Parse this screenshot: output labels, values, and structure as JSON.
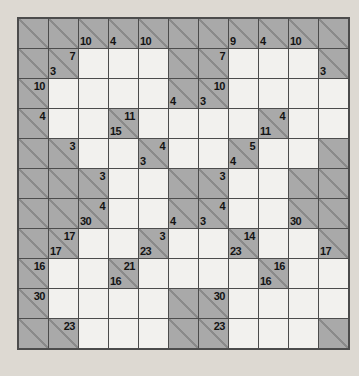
{
  "puzzle": {
    "type": "kakuro",
    "rows": 11,
    "cols": 11,
    "legend": {
      "X": "blocked gray cell with diagonal",
      ".": "white entry cell",
      "a": "across clue (top-right of diagonal)",
      "d": "down clue (bottom-left of diagonal)"
    },
    "cells": [
      [
        "X",
        "X",
        {
          "d": 10
        },
        {
          "d": 4
        },
        {
          "d": 10
        },
        "X",
        "X",
        {
          "d": 9
        },
        {
          "d": 4
        },
        {
          "d": 10
        },
        "X"
      ],
      [
        "X",
        {
          "a": 7,
          "d": 3
        },
        ".",
        ".",
        ".",
        "X",
        {
          "a": 7
        },
        ".",
        ".",
        ".",
        {
          "d": 3
        }
      ],
      [
        {
          "a": 10
        },
        ".",
        ".",
        ".",
        ".",
        {
          "d": 4
        },
        {
          "a": 10,
          "d": 3
        },
        ".",
        ".",
        ".",
        "."
      ],
      [
        {
          "a": 4
        },
        ".",
        ".",
        {
          "a": 11,
          "d": 15
        },
        ".",
        ".",
        ".",
        ".",
        {
          "a": 4,
          "d": 11
        },
        ".",
        "."
      ],
      [
        "X",
        {
          "a": 3
        },
        ".",
        ".",
        {
          "a": 4,
          "d": 3
        },
        ".",
        ".",
        {
          "a": 5,
          "d": 4
        },
        ".",
        ".",
        "X"
      ],
      [
        "X",
        "X",
        {
          "a": 3
        },
        ".",
        ".",
        "X",
        {
          "a": 3
        },
        ".",
        ".",
        "X",
        "X"
      ],
      [
        "X",
        "X",
        {
          "a": 4,
          "d": 30
        },
        ".",
        ".",
        {
          "d": 4
        },
        {
          "a": 4,
          "d": 3
        },
        ".",
        ".",
        {
          "d": 30
        },
        "X"
      ],
      [
        "X",
        {
          "a": 17,
          "d": 17
        },
        ".",
        ".",
        {
          "a": 3,
          "d": 23
        },
        ".",
        ".",
        {
          "a": 14,
          "d": 23
        },
        ".",
        ".",
        {
          "d": 17
        }
      ],
      [
        {
          "a": 16
        },
        ".",
        ".",
        {
          "a": 21,
          "d": 16
        },
        ".",
        ".",
        ".",
        ".",
        {
          "a": 16,
          "d": 16
        },
        ".",
        "."
      ],
      [
        {
          "a": 30
        },
        ".",
        ".",
        ".",
        ".",
        "X",
        {
          "a": 30
        },
        ".",
        ".",
        ".",
        "."
      ],
      [
        "X",
        {
          "a": 23
        },
        ".",
        ".",
        ".",
        "X",
        {
          "a": 23
        },
        ".",
        ".",
        ".",
        "X"
      ]
    ]
  },
  "colors": {
    "page_bg": "#ddd9d2",
    "cell_gray": "#a9a9a9",
    "cell_white": "#f2f1ee",
    "grid_line": "#4c4c4c",
    "diag_line": "#8a8a8a",
    "clue_text": "#141414"
  }
}
